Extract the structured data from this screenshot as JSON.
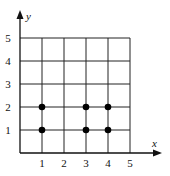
{
  "chart_data": {
    "type": "scatter",
    "title": "",
    "xlabel": "x",
    "ylabel": "y",
    "xlim": [
      0,
      5
    ],
    "ylim": [
      0,
      5
    ],
    "grid": true,
    "x_ticks": [
      "1",
      "2",
      "3",
      "4",
      "5"
    ],
    "y_ticks": [
      "1",
      "2",
      "3",
      "4",
      "5"
    ],
    "points": [
      {
        "x": 1,
        "y": 1
      },
      {
        "x": 1,
        "y": 2
      },
      {
        "x": 3,
        "y": 1
      },
      {
        "x": 3,
        "y": 2
      },
      {
        "x": 4,
        "y": 1
      },
      {
        "x": 4,
        "y": 2
      }
    ],
    "colors": {
      "grid": "#222222",
      "points": "#000000"
    }
  }
}
